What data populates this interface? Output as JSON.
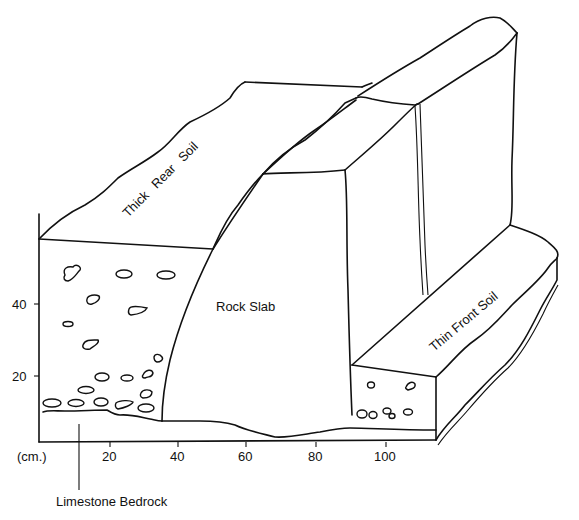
{
  "diagram": {
    "labels": {
      "thick_rear_soil": "Thick Rear Soil",
      "rock_slab": "Rock Slab",
      "thin_front_soil": "Thin Front Soil",
      "limestone_bedrock": "Limestone Bedrock"
    },
    "x_axis": {
      "unit": "(cm.)",
      "ticks": [
        "20",
        "40",
        "60",
        "80",
        "100"
      ]
    },
    "y_axis": {
      "ticks": [
        "20",
        "40"
      ]
    }
  }
}
